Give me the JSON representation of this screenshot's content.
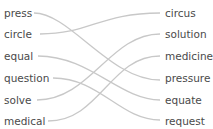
{
  "left_words": [
    "press",
    "circle",
    "equal",
    "question",
    "solve",
    "medical"
  ],
  "right_words": [
    "circus",
    "solution",
    "medicine",
    "pressure",
    "equate",
    "request"
  ],
  "matches": [
    {
      "from": "press",
      "to": "pressure"
    },
    {
      "from": "circle",
      "to": "circus"
    },
    {
      "from": "equal",
      "to": "equate"
    },
    {
      "from": "question",
      "to": "request"
    },
    {
      "from": "solve",
      "to": "solution"
    },
    {
      "from": "medical",
      "to": "medicine"
    }
  ],
  "colors": {
    "text": "#4a4a4a",
    "line": "#c8c8c8"
  }
}
